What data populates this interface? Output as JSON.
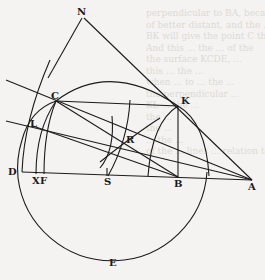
{
  "figure": {
    "points": {
      "N": "N",
      "C": "C",
      "K": "K",
      "L": "L",
      "R": "R",
      "D": "D",
      "X": "X",
      "F": "F",
      "S": "S",
      "B": "B",
      "A": "A",
      "E": "E"
    }
  },
  "bleed_through_text": [
    "perpendicular to BA, because the same",
    "of better distant, and the ...",
    "BK will give the point C through ...",
    "And this ... the ... of the",
    "the surface KCDE, ...",
    "this ... the ...",
    "when ... to ... the ...",
    "the perpendicular ...",
    "KL ... the ...",
    "the ... ",
    "the ... ",
    "... the ... ",
    "of the ... lines ... relation to ..."
  ]
}
